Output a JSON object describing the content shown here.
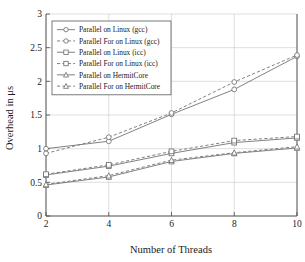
{
  "chart_data": {
    "type": "line",
    "title": "",
    "xlabel": "Number of Threads",
    "ylabel": "Overhead in μs",
    "x": [
      2,
      4,
      6,
      8,
      10
    ],
    "xlim": [
      2,
      10
    ],
    "ylim": [
      0,
      3
    ],
    "xticks": [
      "2",
      "4",
      "6",
      "8",
      "10"
    ],
    "yticks": [
      "0",
      "0.5",
      "1",
      "1.5",
      "2",
      "2.5",
      "3"
    ],
    "grid": true,
    "legend_position": "upper left",
    "series": [
      {
        "name": "Parallel on Linux (gcc)",
        "values": [
          1.0,
          1.11,
          1.51,
          1.88,
          2.37
        ],
        "style": "solid",
        "marker": "circle",
        "color": "#6b6b6b"
      },
      {
        "name": "Parallel For on Linux (gcc)",
        "values": [
          0.93,
          1.17,
          1.53,
          1.99,
          2.39
        ],
        "style": "dashed",
        "marker": "circle",
        "color": "#6b6b6b"
      },
      {
        "name": "Parallel on Linux (icc)",
        "values": [
          0.61,
          0.74,
          0.93,
          1.09,
          1.16
        ],
        "style": "solid",
        "marker": "square",
        "color": "#6b6b6b"
      },
      {
        "name": "Parallel For on Linux (icc)",
        "values": [
          0.62,
          0.76,
          0.96,
          1.12,
          1.18
        ],
        "style": "dashed",
        "marker": "square",
        "color": "#6b6b6b"
      },
      {
        "name": "Parallel on HermitCore",
        "values": [
          0.46,
          0.58,
          0.81,
          0.93,
          1.01
        ],
        "style": "solid",
        "marker": "triangle",
        "color": "#6b6b6b"
      },
      {
        "name": "Parallel For on HermitCore",
        "values": [
          0.47,
          0.6,
          0.83,
          0.94,
          1.03
        ],
        "style": "dashed",
        "marker": "triangle",
        "color": "#6b6b6b"
      }
    ]
  },
  "legend": {
    "entries": [
      "Parallel on Linux (gcc)",
      "Parallel For on Linux (gcc)",
      "Parallel on Linux (icc)",
      "Parallel For on Linux (icc)",
      "Parallel on HermitCore",
      "Parallel For on HermitCore"
    ]
  },
  "axes": {
    "x_title": "Number of Threads",
    "y_title": "Overhead in μs",
    "x_tick_labels": [
      "2",
      "4",
      "6",
      "8",
      "10"
    ],
    "y_tick_labels": [
      "0",
      "0.5",
      "1",
      "1.5",
      "2",
      "2.5",
      "3"
    ]
  },
  "colors": {
    "line": "#6b6b6b",
    "grid": "#c9c9c9",
    "axis": "#4a4a4a",
    "text": "#1a1a1a",
    "background": "#ffffff"
  }
}
